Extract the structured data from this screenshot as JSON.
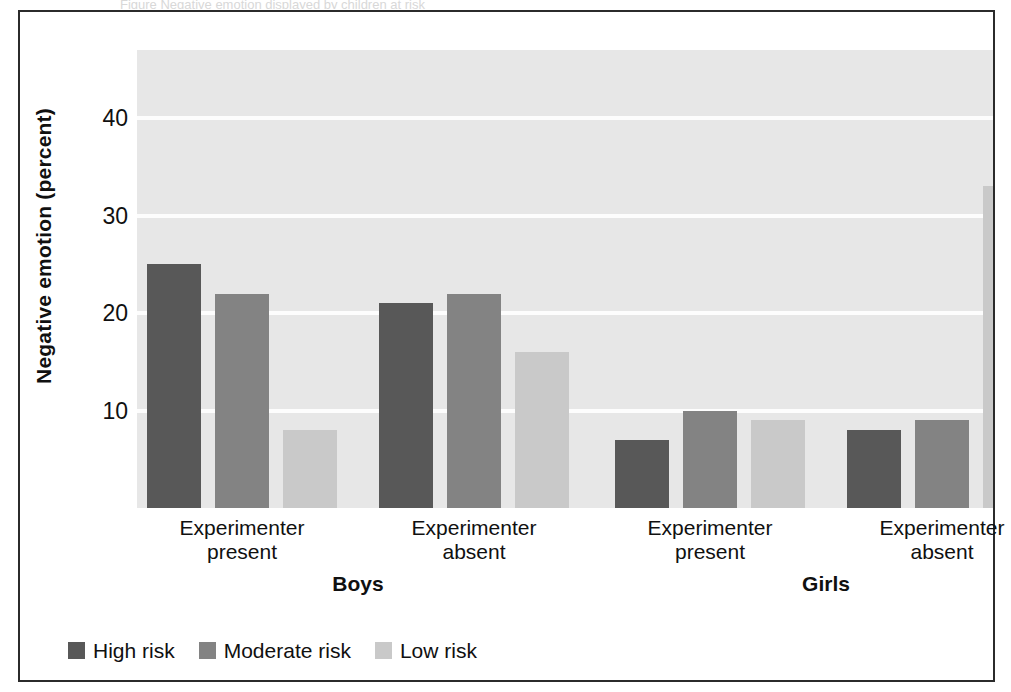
{
  "figure": {
    "top_caption": "Figure  Negative emotion displayed by children at risk",
    "frame_color": "#2b2b2b",
    "plot_background": "#e7e7e7"
  },
  "chart_data": {
    "type": "bar",
    "title": "",
    "xlabel": "",
    "ylabel": "Negative emotion (percent)",
    "ylim": [
      0,
      47
    ],
    "yticks": [
      10,
      20,
      30,
      40
    ],
    "ytick_labels": [
      "10",
      "20",
      "30",
      "40"
    ],
    "grid": true,
    "grid_axis": "y",
    "legend_position": "bottom-left",
    "group_labels": [
      "Boys",
      "Girls"
    ],
    "categories": [
      "Experimenter present",
      "Experimenter absent",
      "Experimenter present",
      "Experimenter absent"
    ],
    "category_lines": [
      [
        "Experimenter",
        "present"
      ],
      [
        "Experimenter",
        "absent"
      ],
      [
        "Experimenter",
        "present"
      ],
      [
        "Experimenter",
        "absent"
      ]
    ],
    "series": [
      {
        "name": "High risk",
        "color": "#585858",
        "values": [
          25,
          21,
          7,
          8
        ]
      },
      {
        "name": "Moderate risk",
        "color": "#838383",
        "values": [
          22,
          22,
          10,
          9
        ]
      },
      {
        "name": "Low risk",
        "color": "#c9c9c9",
        "values": [
          8,
          16,
          9,
          33
        ]
      }
    ]
  },
  "legend": {
    "items": [
      {
        "label": "High risk",
        "color": "#585858"
      },
      {
        "label": "Moderate risk",
        "color": "#838383"
      },
      {
        "label": "Low risk",
        "color": "#c9c9c9"
      }
    ]
  },
  "axis": {
    "y_title": "Negative emotion (percent)"
  }
}
